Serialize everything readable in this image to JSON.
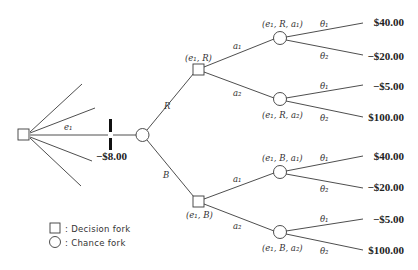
{
  "diagram": {
    "type": "decision-tree",
    "root": {
      "shape": "decision-fork"
    },
    "experiment_branch": {
      "label": "e₁",
      "cost": "−$8.00"
    },
    "first_chance": {
      "outcomes": [
        {
          "label": "R",
          "node_label": "(e₁, R)"
        },
        {
          "label": "B",
          "node_label": "(e₁, B)"
        }
      ]
    },
    "actions": {
      "a1": "a₁",
      "a2": "a₂"
    },
    "chance_nodes": {
      "R_a1": "(e₁, R, a₁)",
      "R_a2": "(e₁, R, a₂)",
      "B_a1": "(e₁, B, a₁)",
      "B_a2": "(e₁, B, a₂)"
    },
    "states": {
      "t1": "θ₁",
      "t2": "θ₂"
    },
    "payoffs": {
      "R_a1_t1": "$40.00",
      "R_a1_t2": "−$20.00",
      "R_a2_t1": "−$5.00",
      "R_a2_t2": "$100.00",
      "B_a1_t1": "$40.00",
      "B_a1_t2": "−$20.00",
      "B_a2_t1": "−$5.00",
      "B_a2_t2": "$100.00"
    }
  },
  "legend": {
    "decision": ": Decision fork",
    "chance": ": Chance fork"
  }
}
